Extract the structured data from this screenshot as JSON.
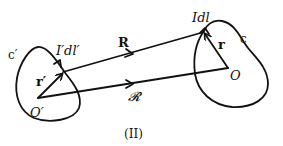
{
  "diagram": {
    "caption": "(II)",
    "left_circuit": {
      "curve_label": "c′",
      "origin_label": "O′",
      "position_vector_label": "r′",
      "current_element_label": "I′dl′"
    },
    "right_circuit": {
      "curve_label": "c",
      "origin_label": "O",
      "position_vector_label": "r",
      "current_element_label": "Idl"
    },
    "separation_vector_label": "R",
    "origin_separation_label": "𝓡"
  }
}
